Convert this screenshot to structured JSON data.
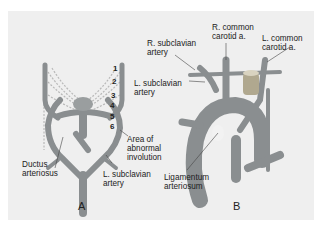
{
  "figure": {
    "panel_a": {
      "caption": "A",
      "arch_numbers": [
        "1",
        "2",
        "3",
        "4",
        "5",
        "6"
      ],
      "labels": {
        "ductus_arteriosus": [
          "Ductus",
          "arteriosus"
        ],
        "area_abnormal": [
          "Area of",
          "abnormal",
          "involution"
        ],
        "l_subclavian": [
          "L. subclavian",
          "artery"
        ]
      }
    },
    "panel_b": {
      "caption": "B",
      "labels": {
        "r_subclavian": [
          "R. subclavian",
          "artery"
        ],
        "r_common_carotid": [
          "R. common",
          "carotid a."
        ],
        "l_common_carotid": [
          "L. common",
          "carotid a."
        ],
        "l_subclavian": [
          "L. subclavian",
          "artery"
        ],
        "ligamentum": [
          "Ligamentum",
          "arteriosum"
        ]
      }
    },
    "colors": {
      "background": "#efefef",
      "vessel": "#8a8e90",
      "vessel_dark": "#6f7375",
      "dashed": "#b8b8b8"
    }
  }
}
